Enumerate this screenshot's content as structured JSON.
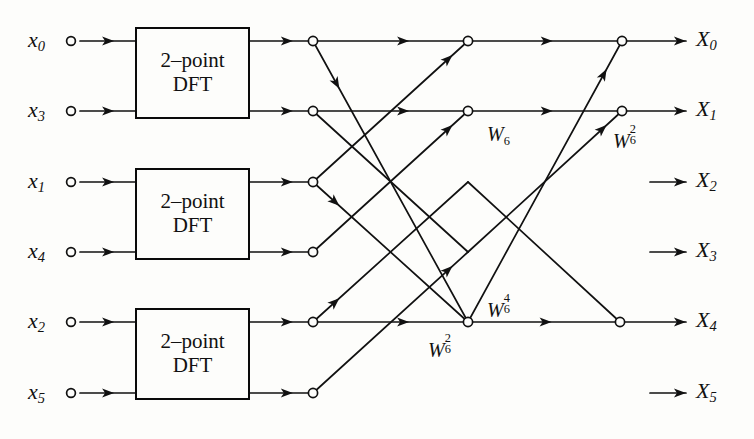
{
  "figure": {
    "type": "signal-flow-graph",
    "width": 754,
    "height": 439,
    "line_color": "#111111",
    "background_color": "#fdfdfb"
  },
  "inputs": [
    {
      "id": "x0",
      "base": "x",
      "index": "0",
      "x": 71,
      "y": 41
    },
    {
      "id": "x3",
      "base": "x",
      "index": "3",
      "x": 71,
      "y": 111
    },
    {
      "id": "x1",
      "base": "x",
      "index": "1",
      "x": 71,
      "y": 182
    },
    {
      "id": "x4",
      "base": "x",
      "index": "4",
      "x": 71,
      "y": 252
    },
    {
      "id": "x2",
      "base": "x",
      "index": "2",
      "x": 71,
      "y": 322
    },
    {
      "id": "x5",
      "base": "x",
      "index": "5",
      "x": 71,
      "y": 393
    }
  ],
  "outputs": [
    {
      "id": "X0",
      "base": "X",
      "index": "0",
      "y": 41,
      "arrow_start": 640,
      "arrow_end": 686,
      "label_x": 696
    },
    {
      "id": "X1",
      "base": "X",
      "index": "1",
      "y": 111,
      "arrow_start": 640,
      "arrow_end": 686,
      "label_x": 696
    },
    {
      "id": "X2",
      "base": "X",
      "index": "2",
      "y": 182,
      "arrow_start": 650,
      "arrow_end": 686,
      "label_x": 696
    },
    {
      "id": "X3",
      "base": "X",
      "index": "3",
      "y": 252,
      "arrow_start": 650,
      "arrow_end": 686,
      "label_x": 696
    },
    {
      "id": "X4",
      "base": "X",
      "index": "4",
      "y": 322,
      "arrow_start": 640,
      "arrow_end": 686,
      "label_x": 696
    },
    {
      "id": "X5",
      "base": "X",
      "index": "5",
      "y": 393,
      "arrow_start": 650,
      "arrow_end": 686,
      "label_x": 696
    }
  ],
  "dft_boxes": [
    {
      "id": "dft-top",
      "line1": "2–point",
      "line2": "DFT",
      "x": 135,
      "y": 27,
      "w": 115,
      "h": 92
    },
    {
      "id": "dft-middle",
      "line1": "2–point",
      "line2": "DFT",
      "x": 135,
      "y": 168,
      "w": 115,
      "h": 92
    },
    {
      "id": "dft-bottom",
      "line1": "2–point",
      "line2": "DFT",
      "x": 135,
      "y": 308,
      "w": 115,
      "h": 92
    }
  ],
  "nodes": [
    {
      "id": "n-s1-r0",
      "stage": 1,
      "row": 0,
      "x": 313,
      "y": 41
    },
    {
      "id": "n-s1-r1",
      "stage": 1,
      "row": 1,
      "x": 313,
      "y": 111
    },
    {
      "id": "n-s1-r2",
      "stage": 1,
      "row": 2,
      "x": 313,
      "y": 182
    },
    {
      "id": "n-s1-r3",
      "stage": 1,
      "row": 3,
      "x": 313,
      "y": 252
    },
    {
      "id": "n-s1-r4",
      "stage": 1,
      "row": 4,
      "x": 313,
      "y": 322
    },
    {
      "id": "n-s1-r5",
      "stage": 1,
      "row": 5,
      "x": 313,
      "y": 393
    },
    {
      "id": "n-s2-r0",
      "stage": 2,
      "row": 0,
      "x": 468,
      "y": 41
    },
    {
      "id": "n-s2-r1",
      "stage": 2,
      "row": 1,
      "x": 468,
      "y": 111
    },
    {
      "id": "n-s2-r4",
      "stage": 2,
      "row": 4,
      "x": 468,
      "y": 322
    },
    {
      "id": "n-s3-r0",
      "stage": 3,
      "row": 0,
      "x": 622,
      "y": 41
    },
    {
      "id": "n-s3-r1",
      "stage": 3,
      "row": 1,
      "x": 622,
      "y": 111
    },
    {
      "id": "n-s3-r4",
      "stage": 3,
      "row": 4,
      "x": 620,
      "y": 322
    }
  ],
  "twiddle_labels": [
    {
      "id": "w6-1",
      "base": "W",
      "sub": "6",
      "sup": "",
      "x": 487,
      "y": 124
    },
    {
      "id": "w6-2",
      "base": "W",
      "sub": "6",
      "sup": "2",
      "x": 613,
      "y": 128
    },
    {
      "id": "w6-4",
      "base": "W",
      "sub": "6",
      "sup": "4",
      "x": 487,
      "y": 297
    },
    {
      "id": "w6-2b",
      "base": "W",
      "sub": "6",
      "sup": "2",
      "x": 428,
      "y": 337
    }
  ],
  "input_wires": [
    {
      "from_x": 80,
      "to_x": 135,
      "y": 41
    },
    {
      "from_x": 80,
      "to_x": 135,
      "y": 111
    },
    {
      "from_x": 80,
      "to_x": 135,
      "y": 182
    },
    {
      "from_x": 80,
      "to_x": 135,
      "y": 252
    },
    {
      "from_x": 80,
      "to_x": 135,
      "y": 322
    },
    {
      "from_x": 80,
      "to_x": 135,
      "y": 393
    }
  ],
  "box_out_wires": [
    {
      "from_x": 250,
      "to_x": 313,
      "y": 41
    },
    {
      "from_x": 250,
      "to_x": 313,
      "y": 111
    },
    {
      "from_x": 250,
      "to_x": 313,
      "y": 182
    },
    {
      "from_x": 250,
      "to_x": 313,
      "y": 252
    },
    {
      "from_x": 250,
      "to_x": 313,
      "y": 322
    },
    {
      "from_x": 250,
      "to_x": 313,
      "y": 393
    }
  ],
  "horizontal_segments": [
    {
      "id": "h-s1s2-r0",
      "x1": 313,
      "x2": 468,
      "y": 41,
      "arrow_at": 0.62
    },
    {
      "id": "h-s1s2-r1",
      "x1": 313,
      "x2": 468,
      "y": 111,
      "arrow_at": 0.62
    },
    {
      "id": "h-s1s2-r4",
      "x1": 313,
      "x2": 468,
      "y": 322,
      "arrow_at": 0.62
    },
    {
      "id": "h-s2s3-r0",
      "x1": 468,
      "x2": 622,
      "y": 41,
      "arrow_at": 0.55
    },
    {
      "id": "h-s2s3-r1",
      "x1": 468,
      "x2": 622,
      "y": 111,
      "arrow_at": 0.55
    },
    {
      "id": "h-s2s3-r4",
      "x1": 468,
      "x2": 620,
      "y": 322,
      "arrow_at": 0.55
    },
    {
      "id": "h-s3out-r0",
      "x1": 622,
      "x2": 686,
      "y": 41,
      "arrow_at": 1.0
    },
    {
      "id": "h-s3out-r1",
      "x1": 622,
      "x2": 686,
      "y": 111,
      "arrow_at": 1.0
    },
    {
      "id": "h-s3out-r4",
      "x1": 620,
      "x2": 686,
      "y": 322,
      "arrow_at": 1.0
    }
  ],
  "diagonal_edges": [
    {
      "id": "d-r0-down",
      "x1": 313,
      "y1": 41,
      "x2": 468,
      "y2": 322,
      "arrow": "start"
    },
    {
      "id": "d-r2-up",
      "x1": 313,
      "y1": 182,
      "x2": 468,
      "y2": 41,
      "arrow": "end"
    },
    {
      "id": "d-r2-down",
      "x1": 313,
      "y1": 182,
      "x2": 468,
      "y2": 322,
      "arrow": "start"
    },
    {
      "id": "d-r3-up",
      "x1": 313,
      "y1": 252,
      "x2": 468,
      "y2": 111,
      "arrow": "end"
    },
    {
      "id": "d-r4-up",
      "x1": 313,
      "y1": 322,
      "x2": 468,
      "y2": 182,
      "arrow": "start"
    },
    {
      "id": "d-r5-up",
      "x1": 313,
      "y1": 393,
      "x2": 468,
      "y2": 252,
      "arrow": "end"
    },
    {
      "id": "d-s2-r4up",
      "x1": 468,
      "y1": 322,
      "x2": 622,
      "y2": 41,
      "arrow": "end"
    },
    {
      "id": "d-s2-r1up",
      "x1": 468,
      "y1": 252,
      "x2": 622,
      "y2": 111,
      "arrow": "end"
    },
    {
      "id": "d-s2-down",
      "x1": 468,
      "y1": 182,
      "x2": 620,
      "y2": 322,
      "arrow": "none"
    },
    {
      "id": "d-s1-long",
      "x1": 313,
      "y1": 111,
      "x2": 468,
      "y2": 252,
      "arrow": "none"
    }
  ]
}
